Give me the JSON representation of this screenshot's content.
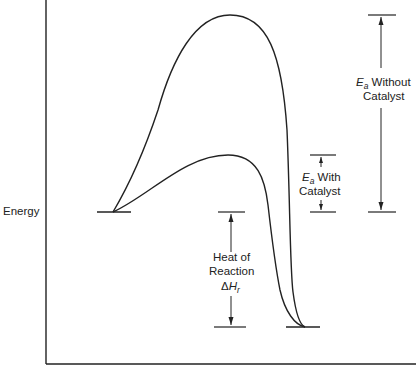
{
  "diagram": {
    "type": "energy-profile",
    "y_axis_label": "Energy",
    "curves": [
      {
        "name": "without-catalyst",
        "description": "Higher activation energy peak"
      },
      {
        "name": "with-catalyst",
        "description": "Lower activation energy peak"
      }
    ],
    "annotations": {
      "ea_without": {
        "symbol": "E",
        "subscript": "a",
        "text": " Without",
        "line2": "Catalyst"
      },
      "ea_with": {
        "symbol": "E",
        "subscript": "a",
        "text": " With",
        "line2": "Catalyst"
      },
      "heat": {
        "line1": "Heat of",
        "line2": "Reaction",
        "delta": "Δ",
        "symbol": "H",
        "subscript": "r"
      }
    },
    "levels": {
      "reactants": "higher energy",
      "products": "lower energy"
    },
    "colors": {
      "line": "#222222",
      "background": "#ffffff"
    }
  }
}
